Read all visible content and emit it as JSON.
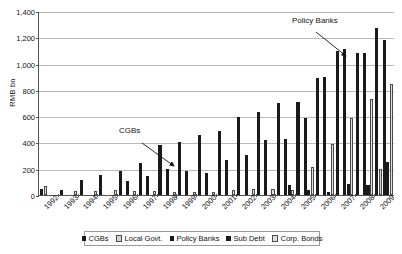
{
  "chart_data": {
    "type": "bar",
    "title": "",
    "xlabel": "",
    "ylabel": "RMB bn",
    "ylim": [
      0,
      1400
    ],
    "yticks": [
      "0",
      "200",
      "400",
      "600",
      "800",
      "1,000",
      "1,200",
      "1,400"
    ],
    "grid": true,
    "legend_position": "bottom",
    "categories": [
      "1992",
      "1993",
      "1994",
      "1995",
      "1996",
      "1997",
      "1998",
      "1999",
      "2000",
      "2001",
      "2002",
      "2003",
      "2004",
      "2005",
      "2006",
      "2007",
      "2008",
      "2009"
    ],
    "series": [
      {
        "name": "CGBs",
        "color": "#1a1a1a",
        "values": [
          46,
          38,
          115,
          152,
          185,
          242,
          381,
          401,
          457,
          488,
          593,
          628,
          697,
          706,
          888,
          1093,
          1080,
          1272
        ]
      },
      {
        "name": "Local Govt.",
        "color": "#d6d6d6",
        "values": [
          66,
          0,
          0,
          0,
          0,
          0,
          0,
          0,
          0,
          0,
          0,
          0,
          0,
          0,
          0,
          0,
          0,
          200
        ]
      },
      {
        "name": "Policy Banks",
        "color": "#1a1a1a",
        "values": [
          0,
          0,
          0,
          0,
          107,
          146,
          195,
          180,
          164,
          264,
          307,
          421,
          427,
          585,
          897,
          1109,
          1080,
          1180
        ]
      },
      {
        "name": "Sub Debt",
        "color": "#1a1a1a",
        "values": [
          0,
          0,
          0,
          0,
          0,
          0,
          0,
          0,
          0,
          0,
          0,
          0,
          75,
          35,
          25,
          86,
          73,
          255
        ]
      },
      {
        "name": "Corp. Bonds",
        "color": "#dedede",
        "values": [
          0,
          28,
          27,
          38,
          32,
          32,
          21,
          21,
          21,
          36,
          46,
          47,
          39,
          215,
          388,
          589,
          732,
          845
        ]
      }
    ],
    "annotations": [
      {
        "id": "cgbs-annotation",
        "text": "CGBs",
        "label_x": 119,
        "label_y": 126,
        "arrow": {
          "x1": 142,
          "y1": 143,
          "x2": 174,
          "y2": 166
        }
      },
      {
        "id": "policy-annotation",
        "text": "Policy Banks",
        "label_x": 292,
        "label_y": 16,
        "arrow": {
          "x1": 316,
          "y1": 32,
          "x2": 346,
          "y2": 56
        }
      }
    ]
  }
}
